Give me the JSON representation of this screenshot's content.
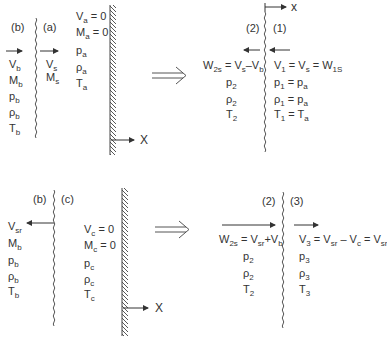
{
  "panel_top_left": {
    "region_b_label": "(b)",
    "region_a_label": "(a)",
    "region_b_vars": [
      "V_b",
      "M_b",
      "p_b",
      "ρ_b",
      "T_b"
    ],
    "region_a_vars": [
      "V_s",
      "M_s"
    ],
    "wall_side_vars": [
      "V_a = 0",
      "M_a = 0",
      "p_a",
      "ρ_a",
      "T_a"
    ],
    "axis_label": "X"
  },
  "transform_arrow": "⟹",
  "panel_top_right": {
    "region_2_label": "(2)",
    "region_1_label": "(1)",
    "axis_label": "x",
    "left_vars": [
      "W_2s = V_s–V_b",
      "p_2",
      "ρ_2",
      "T_2"
    ],
    "right_vars": [
      "V_1 = V_s = W_1S",
      "p_1 = p_a",
      "ρ_1 = p_a",
      "T_1 = T_a"
    ]
  },
  "panel_bottom_left": {
    "region_b_label": "(b)",
    "region_c_label": "(c)",
    "region_b_vars": [
      "V_sr",
      "M_b",
      "p_b",
      "ρ_b",
      "T_b"
    ],
    "wall_side_vars": [
      "V_c = 0",
      "M_c = 0",
      "p_c",
      "ρ_c",
      "T_c"
    ],
    "axis_label": "X"
  },
  "panel_bottom_right": {
    "region_2_label": "(2)",
    "region_3_label": "(3)",
    "left_vars": [
      "W_2s = V_sr+V_b",
      "p_2",
      "ρ_2",
      "T_2"
    ],
    "right_vars": [
      "V_3 = V_sr – V_c = V_sr",
      "p_3",
      "ρ_3",
      "T_3"
    ]
  }
}
